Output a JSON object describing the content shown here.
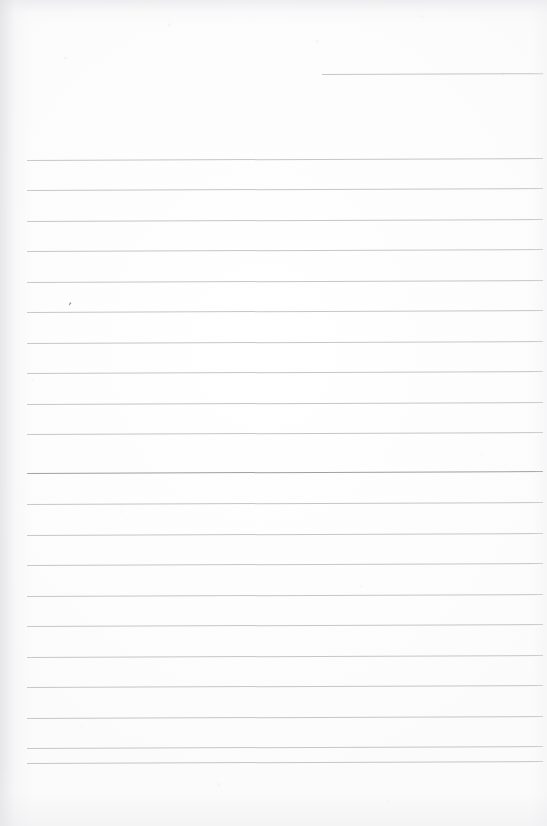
{
  "document": {
    "kind": "scanned-ruled-notebook-page",
    "title": "Blank lined paper",
    "width": 547,
    "height": 826,
    "background_color": "#fdfdfd",
    "content_text": "",
    "notes": "Blank ruled page with no written text; one faint pen tick mark near the left margin."
  },
  "ruling": {
    "line_color": "#b9b9bb",
    "line_color_emphasis": "#9a9a9d",
    "left_x": 27,
    "right_x": 543,
    "spacing": 30.6,
    "thickness": 1,
    "thickness_emphasis": 1.6,
    "slope_deg": -0.22,
    "count_label": "22",
    "lines": [
      {
        "id": "rule-top-partial",
        "y": 74,
        "x1": 322,
        "x2": 543,
        "weight": "normal",
        "partial": true
      },
      {
        "id": "rule-01",
        "y": 159.5,
        "x1": 27,
        "x2": 543,
        "weight": "normal",
        "partial": false
      },
      {
        "id": "rule-02",
        "y": 190,
        "x1": 27,
        "x2": 543,
        "weight": "normal",
        "partial": false
      },
      {
        "id": "rule-03",
        "y": 220.5,
        "x1": 27,
        "x2": 543,
        "weight": "normal",
        "partial": false
      },
      {
        "id": "rule-04",
        "y": 251,
        "x1": 27,
        "x2": 543,
        "weight": "normal",
        "partial": false
      },
      {
        "id": "rule-05",
        "y": 281.5,
        "x1": 27,
        "x2": 543,
        "weight": "normal",
        "partial": false
      },
      {
        "id": "rule-06",
        "y": 312,
        "x1": 27,
        "x2": 543,
        "weight": "normal",
        "partial": false
      },
      {
        "id": "rule-07",
        "y": 342.5,
        "x1": 27,
        "x2": 543,
        "weight": "normal",
        "partial": false
      },
      {
        "id": "rule-08",
        "y": 373,
        "x1": 27,
        "x2": 543,
        "weight": "normal",
        "partial": false
      },
      {
        "id": "rule-09",
        "y": 403.5,
        "x1": 27,
        "x2": 543,
        "weight": "normal",
        "partial": false
      },
      {
        "id": "rule-10",
        "y": 434,
        "x1": 27,
        "x2": 543,
        "weight": "normal",
        "partial": false
      },
      {
        "id": "rule-11",
        "y": 473,
        "x1": 27,
        "x2": 543,
        "weight": "emphasis",
        "partial": false
      },
      {
        "id": "rule-12",
        "y": 504,
        "x1": 27,
        "x2": 543,
        "weight": "normal",
        "partial": false
      },
      {
        "id": "rule-13",
        "y": 534.5,
        "x1": 27,
        "x2": 543,
        "weight": "normal",
        "partial": false
      },
      {
        "id": "rule-14",
        "y": 565,
        "x1": 27,
        "x2": 543,
        "weight": "normal",
        "partial": false
      },
      {
        "id": "rule-15",
        "y": 595.5,
        "x1": 27,
        "x2": 543,
        "weight": "normal",
        "partial": false
      },
      {
        "id": "rule-16",
        "y": 626,
        "x1": 27,
        "x2": 543,
        "weight": "normal",
        "partial": false
      },
      {
        "id": "rule-17",
        "y": 656.5,
        "x1": 27,
        "x2": 543,
        "weight": "normal",
        "partial": false
      },
      {
        "id": "rule-18",
        "y": 687,
        "x1": 27,
        "x2": 543,
        "weight": "normal",
        "partial": false
      },
      {
        "id": "rule-19",
        "y": 717.5,
        "x1": 27,
        "x2": 543,
        "weight": "normal",
        "partial": false
      },
      {
        "id": "rule-20",
        "y": 748,
        "x1": 27,
        "x2": 543,
        "weight": "normal",
        "partial": false
      },
      {
        "id": "rule-21",
        "y": 763,
        "x1": 27,
        "x2": 543,
        "weight": "normal",
        "partial": false
      }
    ]
  },
  "annotations": {
    "pen_mark": {
      "glyph": "ʹ",
      "x": 68,
      "y": 300,
      "size": 13,
      "rotation_deg": 14,
      "color": "#6d6d70"
    }
  }
}
